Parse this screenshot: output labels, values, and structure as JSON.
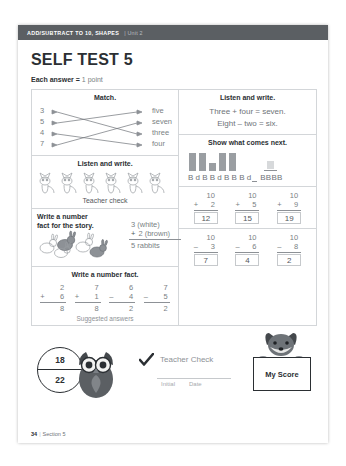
{
  "header": {
    "title": "ADD/SUBTRACT TO 10, SHAPES",
    "unit": "| Unit 2"
  },
  "page": {
    "title": "SELF TEST 5",
    "scoring_label": "Each answer =",
    "scoring_value": "1 point",
    "footer_page": "34",
    "footer_sep": "|",
    "footer_section": "Section 5"
  },
  "match": {
    "heading": "Match.",
    "numbers": [
      "3",
      "5",
      "4",
      "7"
    ],
    "words": [
      "five",
      "seven",
      "three",
      "four"
    ],
    "connections": [
      {
        "from": 0,
        "to": 2
      },
      {
        "from": 1,
        "to": 0
      },
      {
        "from": 2,
        "to": 3
      },
      {
        "from": 3,
        "to": 1
      }
    ]
  },
  "listen_write_left": {
    "heading": "Listen and write.",
    "illustration": "six-cats-illustration",
    "note": "Teacher check"
  },
  "listen_write_right": {
    "heading": "Listen and write.",
    "lines": [
      "Three + four = seven.",
      "Eight – two = six."
    ]
  },
  "story": {
    "heading_line1": "Write a number",
    "heading_line2": "fact for the story.",
    "illustration": "rabbits-illustration",
    "addend1": "3 (white)",
    "operator": "+",
    "addend2": "2 (brown)",
    "total": "5 rabbits"
  },
  "number_facts": {
    "heading": "Write a number fact.",
    "note": "Suggested answers",
    "problems": [
      {
        "top": "2",
        "op": "+",
        "bottom": "6",
        "answer": "8"
      },
      {
        "top": "7",
        "op": "+",
        "bottom": "1",
        "answer": "8"
      },
      {
        "top": "6",
        "op": "–",
        "bottom": "4",
        "answer": "2"
      },
      {
        "top": "7",
        "op": "–",
        "bottom": "5",
        "answer": "2"
      }
    ]
  },
  "pattern": {
    "heading": "Show what comes next.",
    "bars": [
      "tall",
      "tall",
      "short",
      "tall",
      "tall"
    ],
    "answer_bar": "short",
    "letters": "B d B B d B B B d",
    "answer_letters": "BBBB"
  },
  "sums": {
    "row1": [
      {
        "top": "10",
        "op": "+",
        "bottom": "2",
        "answer": "12"
      },
      {
        "top": "10",
        "op": "+",
        "bottom": "5",
        "answer": "15"
      },
      {
        "top": "10",
        "op": "+",
        "bottom": "9",
        "answer": "19"
      }
    ],
    "row2": [
      {
        "top": "10",
        "op": "–",
        "bottom": "3",
        "answer": "7"
      },
      {
        "top": "10",
        "op": "–",
        "bottom": "6",
        "answer": "4"
      },
      {
        "top": "10",
        "op": "–",
        "bottom": "8",
        "answer": "2"
      }
    ]
  },
  "score": {
    "numerator": "18",
    "denominator": "22",
    "owl": "owl-illustration",
    "teacher_check": "Teacher Check",
    "initial_label": "Initial",
    "date_label": "Date",
    "my_score": "My Score",
    "fox": "fox-illustration"
  },
  "colors": {
    "header_bar": "#5b5f63",
    "ink": "#2b2f33",
    "muted": "#7a7f84",
    "rule": "#d3d6d9",
    "bar_fill": "#9a9ea2"
  }
}
